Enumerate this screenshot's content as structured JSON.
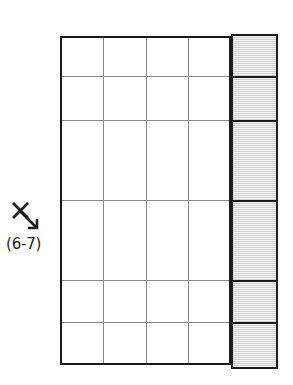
{
  "figure": {
    "name": "grid-diagram-with-shaded-column",
    "background_color": "#ffffff",
    "width": 293,
    "height": 385
  },
  "annotation": {
    "icon_name": "x-with-down-right-arrow-icon",
    "icon_glyph": "X",
    "label": "(6-7)",
    "text_color": "#1b1b1b"
  },
  "grid": {
    "border_color": "#1a1a1a",
    "gridline_color": "#8b8b8b",
    "fill_color": "#ffffff",
    "columns": 4,
    "rows": 6,
    "bounds": {
      "left": 60,
      "top": 36,
      "width": 171,
      "height": 329
    },
    "column_lines_x": [
      103,
      146,
      188
    ],
    "row_lines_y": [
      76,
      120,
      200,
      280,
      322
    ],
    "row_heights": [
      40,
      44,
      80,
      80,
      42,
      43
    ]
  },
  "shaded_column": {
    "name": "shaded-column",
    "fill_color": "#dcdcdc",
    "hatch_color": "#c4c4c4",
    "border_color": "#1a1a1a",
    "bounds": {
      "left": 231,
      "top": 34,
      "width": 47,
      "height": 335
    },
    "segments": 6,
    "divider_y": [
      42,
      86,
      166,
      246,
      288
    ]
  }
}
